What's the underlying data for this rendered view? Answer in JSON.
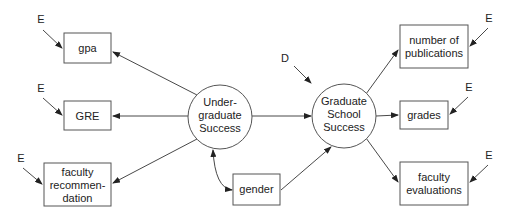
{
  "diagram": {
    "type": "structural-equation-model",
    "latent": {
      "undergrad": {
        "lines": [
          "Under-",
          "graduate",
          "Success"
        ]
      },
      "grad": {
        "lines": [
          "Graduate",
          "School",
          "Success"
        ]
      }
    },
    "observed": {
      "gpa": {
        "lines": [
          "gpa"
        ]
      },
      "gre": {
        "lines": [
          "GRE"
        ]
      },
      "faculty_rec": {
        "lines": [
          "faculty",
          "recommen-",
          "dation"
        ]
      },
      "gender": {
        "lines": [
          "gender"
        ]
      },
      "publications": {
        "lines": [
          "number of",
          "publications"
        ]
      },
      "grades": {
        "lines": [
          "grades"
        ]
      },
      "faculty_eval": {
        "lines": [
          "faculty",
          "evaluations"
        ]
      }
    },
    "error_labels": {
      "gpa": "E",
      "gre": "E",
      "faculty_rec": "E",
      "publications": "E",
      "grades": "E",
      "faculty_eval": "E",
      "disturbance": "D"
    },
    "colors": {
      "stroke": "#555555",
      "text": "#222222",
      "background": "#ffffff"
    }
  }
}
